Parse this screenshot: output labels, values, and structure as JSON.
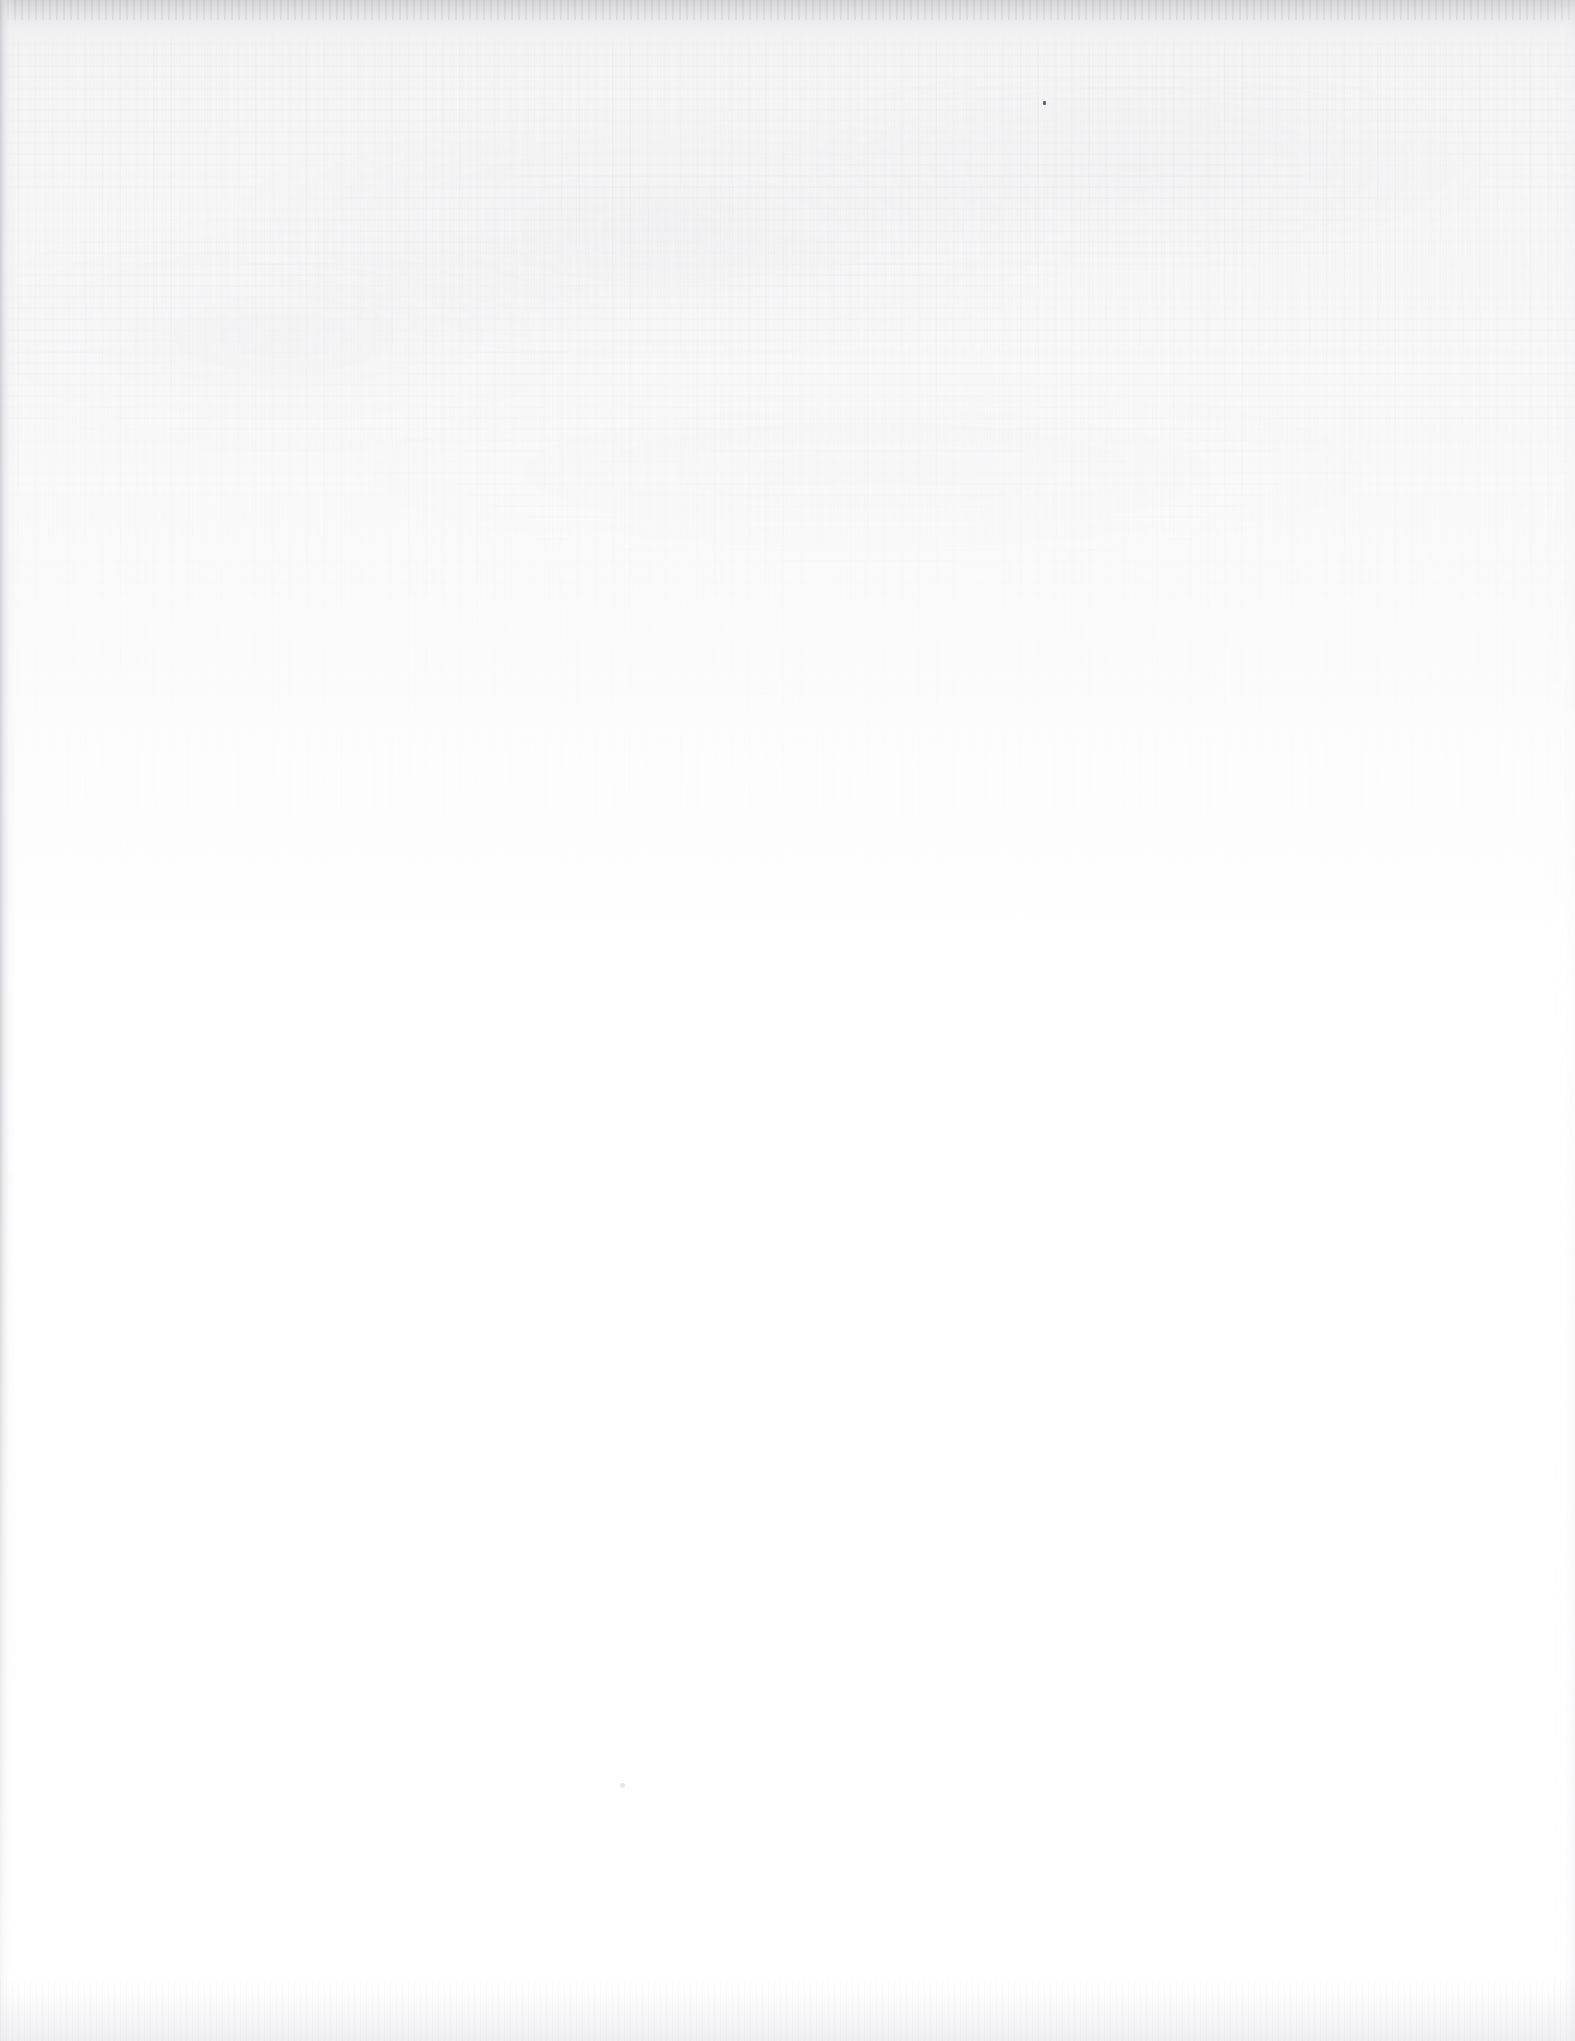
{
  "document": {
    "page_kind": "blank-scanned-page",
    "visible_text": [],
    "headings": [],
    "body_paragraphs": [],
    "page_number": "",
    "header_text": "",
    "footer_text": "",
    "figures": [],
    "tables": [],
    "captions": []
  },
  "scan_artifacts": {
    "paper_color": "#ffffff",
    "upper_tint_color": "#f7f7f8",
    "top_edge_shadow_color": "#d4d4d6",
    "left_edge_shadow_color": "#c6c6ca",
    "bottom_edge_shadow_color": "#e2e2e6",
    "right_edge_shadow_color": "#e8e8ec",
    "grain_description": "fine vertical paper-fibre streaking in the upper portion",
    "specks": [
      {
        "name": "dust-speck-upper-right",
        "x": 1043,
        "y": 101,
        "color": "#4a4a4f"
      },
      {
        "name": "dust-speck-lower-left",
        "x": 620,
        "y": 1783,
        "color": "#cfcfd4"
      }
    ]
  },
  "canvas": {
    "width": 1575,
    "height": 2041
  }
}
